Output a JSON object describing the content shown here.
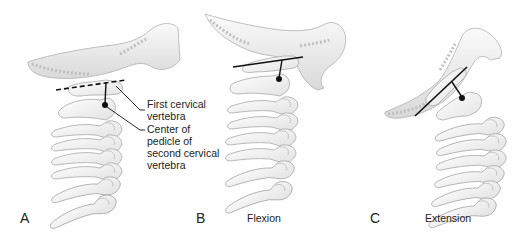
{
  "figure": {
    "panels": [
      {
        "id": "A",
        "letter": "A",
        "caption": "",
        "reference_line_style": "dashed"
      },
      {
        "id": "B",
        "letter": "B",
        "caption": "Flexion",
        "reference_line_style": "solid"
      },
      {
        "id": "C",
        "letter": "C",
        "caption": "Extension",
        "reference_line_style": "solid"
      }
    ],
    "callouts": [
      {
        "target": "first-cervical-vertebra",
        "label": "First cervical\nvertebra"
      },
      {
        "target": "center-of-pedicle-c2",
        "label": "Center of\npedicle of\nsecond cervical\nvertebra"
      }
    ],
    "colors": {
      "bone_fill": "#f4f4f4",
      "bone_stroke": "#a8a8a8",
      "bone_shadow": "#dcdcdc",
      "line": "#111111",
      "text": "#222222"
    }
  }
}
